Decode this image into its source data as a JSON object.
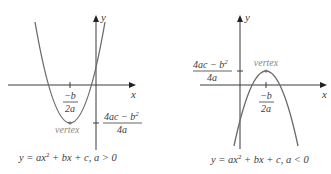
{
  "diagram": {
    "left": {
      "x_axis_label": "x",
      "y_axis_label": "y",
      "vertex_label": "vertex",
      "x_tick_numerator": "−b",
      "x_tick_denominator": "2a",
      "y_tick_numerator": "4ac − b",
      "y_tick_numerator_exp": "2",
      "y_tick_denominator": "4a",
      "caption_pre": "y = ax",
      "caption_exp": "2",
      "caption_post": " + bx + c, a > 0",
      "opens": "up"
    },
    "right": {
      "x_axis_label": "x",
      "y_axis_label": "y",
      "vertex_label": "vertex",
      "x_tick_numerator": "−b",
      "x_tick_denominator": "2a",
      "y_tick_numerator": "4ac − b",
      "y_tick_numerator_exp": "2",
      "y_tick_denominator": "4a",
      "caption_pre": "y = ax",
      "caption_exp": "2",
      "caption_post": " + bx + c, a < 0",
      "opens": "down"
    },
    "colors": {
      "curve": "#6a6a6a",
      "axis": "#3a3a3a",
      "text": "#3c3c3c",
      "vertex_label": "#8a8a8a"
    }
  }
}
